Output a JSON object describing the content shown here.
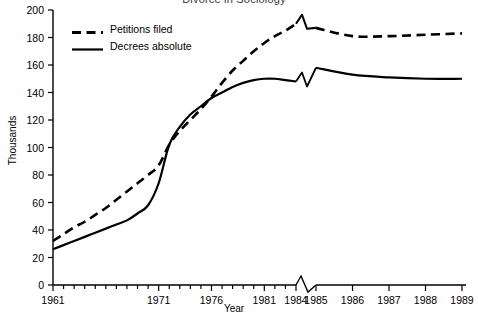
{
  "chart_data": {
    "type": "line",
    "title": "Divorce in Sociology",
    "xlabel": "Year",
    "ylabel": "Thousands",
    "ylim": [
      0,
      200
    ],
    "ytick_values": [
      0,
      20,
      40,
      60,
      80,
      100,
      120,
      140,
      160,
      180,
      200
    ],
    "ytick_labels": [
      "0",
      "20",
      "40",
      "60",
      "80",
      "100",
      "120",
      "140",
      "160",
      "180",
      "200"
    ],
    "grid": false,
    "legend_position": "upper left",
    "axis_break": {
      "present": true,
      "between": [
        "1984",
        "1985"
      ],
      "note": "x-axis scale expands after 1984; both series drawn with a break marker"
    },
    "x_all_years": [
      1961,
      1962,
      1963,
      1964,
      1965,
      1966,
      1967,
      1968,
      1969,
      1970,
      1971,
      1972,
      1973,
      1974,
      1975,
      1976,
      1977,
      1978,
      1979,
      1980,
      1981,
      1982,
      1983,
      1984,
      1985,
      1986,
      1987,
      1988,
      1989
    ],
    "xtick_labels": [
      "1961",
      "1971",
      "1976",
      "1981",
      "1984",
      "1985",
      "1986",
      "1987",
      "1988",
      "1989"
    ],
    "xtick_years": [
      1961,
      1971,
      1976,
      1981,
      1984,
      1985,
      1986,
      1987,
      1988,
      1989
    ],
    "series": [
      {
        "name": "Petitions filed",
        "style": "dashed",
        "color": "#000000",
        "values": [
          32,
          37,
          42,
          46,
          51,
          56,
          62,
          68,
          74,
          80,
          87,
          102,
          112,
          120,
          128,
          137,
          147,
          156,
          163,
          170,
          176,
          181,
          185,
          190,
          187,
          181,
          181,
          182,
          183
        ]
      },
      {
        "name": "Decrees absolute",
        "style": "solid",
        "color": "#000000",
        "values": [
          26,
          29,
          32,
          35,
          38,
          41,
          44,
          47,
          52,
          58,
          74,
          102,
          115,
          124,
          130,
          136,
          140,
          144,
          147,
          149,
          150,
          150,
          149,
          148,
          158,
          153,
          151,
          150,
          150
        ]
      }
    ]
  },
  "legend": {
    "items": [
      {
        "label": "Petitions filed",
        "style": "dashed"
      },
      {
        "label": "Decrees absolute",
        "style": "solid"
      }
    ]
  }
}
